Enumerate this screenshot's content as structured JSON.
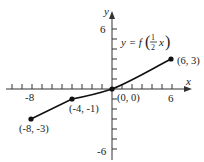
{
  "figure": {
    "caption_fragment": "y = f(1/2 x) graph",
    "equation": {
      "lhs": "y = f",
      "frac_num": "1",
      "frac_den": "2",
      "var": "x"
    },
    "axes": {
      "x_label": "x",
      "y_label": "y",
      "x_ticks_labeled": [
        "-8",
        "6"
      ],
      "y_ticks_labeled": [
        "6",
        "-6"
      ]
    },
    "points": [
      {
        "label": "(-8, -3)",
        "x": -8,
        "y": -3
      },
      {
        "label": "(-4, -1)",
        "x": -4,
        "y": -1
      },
      {
        "label": "(0, 0)",
        "x": 0,
        "y": 0
      },
      {
        "label": "(6, 3)",
        "x": 6,
        "y": 3
      }
    ],
    "colors": {
      "line": "#111111",
      "axis": "#333333",
      "text": "#222222"
    }
  }
}
